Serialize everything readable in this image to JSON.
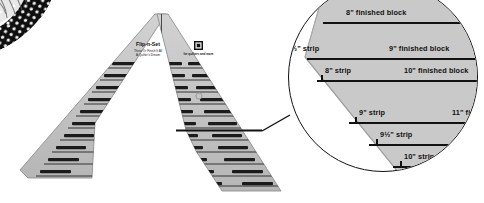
{
  "scene": {
    "title": "Flip-n-Set quilting ruler with magnified detail callout",
    "background_color": "#ffffff",
    "ruler_fill_color": "#c6c6c6",
    "ruler_edge_color": "#8a8a8a",
    "line_color": "#111111",
    "magnifier_border_color": "#111111"
  },
  "fabric_swatch": {
    "name": "polka-dot fabric corner",
    "base_color": "#101010",
    "dot_color": "#f2f2f2"
  },
  "ruler": {
    "brand": "Flip-n-Set",
    "tagline": "Three Or Finish It All",
    "sub_tagline": "A Quilter's Dream",
    "badge_text": "NEW",
    "badge_sub": "for quilters and more",
    "shape": "chevron",
    "left_arm_rows": [
      {
        "strip": "3\" strip",
        "block": "3\" finished block"
      },
      {
        "strip": "3½\" strip",
        "block": "4\" finished block"
      },
      {
        "strip": "4\" strip",
        "block": "5\" finished block"
      },
      {
        "strip": "4½\" strip",
        "block": "6\" finished block"
      },
      {
        "strip": "5\" strip",
        "block": "7\" finished block"
      },
      {
        "strip": "5½\" strip",
        "block": "8\" finished block"
      },
      {
        "strip": "6\" strip",
        "block": "9\" finished block"
      },
      {
        "strip": "6½\" strip",
        "block": "10\" finished block"
      },
      {
        "strip": "7\" strip",
        "block": "11\" finished block"
      },
      {
        "strip": "7½\" strip",
        "block": "12\" finished block"
      },
      {
        "strip": "8\" strip",
        "block": "13\" finished block"
      },
      {
        "strip": "8½\" strip",
        "block": "14\" finished block"
      },
      {
        "strip": "9\" strip",
        "block": "15\" finished block"
      }
    ],
    "right_arm_rows": [
      {
        "strip": "3\" strip",
        "block": "3\" finished block"
      },
      {
        "strip": "3½\" strip",
        "block": "4\" finished block"
      },
      {
        "strip": "4\" strip",
        "block": "5\" finished block"
      },
      {
        "strip": "4½\" strip",
        "block": "6\" finished block"
      },
      {
        "strip": "5\" strip",
        "block": "7\" finished block"
      },
      {
        "strip": "5½\" strip",
        "block": "8\" finished block"
      },
      {
        "strip": "6\" strip",
        "block": "9\" finished block"
      },
      {
        "strip": "6½\" strip",
        "block": "10\" finished block"
      },
      {
        "strip": "7\" strip",
        "block": "11\" finished block"
      },
      {
        "strip": "7½\" strip",
        "block": "12\" finished block"
      },
      {
        "strip": "8\" strip",
        "block": "13\" finished block"
      },
      {
        "strip": "8½\" strip",
        "block": "14\" finished block"
      },
      {
        "strip": "9\" strip",
        "block": "15\" finished block"
      }
    ]
  },
  "magnifier": {
    "name": "detail-magnifier",
    "labels_right": [
      "8\" finished block",
      "9\" finished block",
      "10\" finished block",
      "11\" fi"
    ],
    "labels_left": [
      "½\" strip",
      "8\" strip",
      "9\" strip",
      "9½\" strip",
      "10\" strip"
    ]
  }
}
